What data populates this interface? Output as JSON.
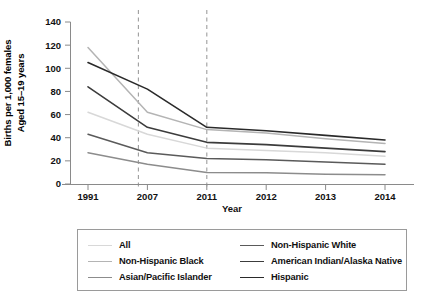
{
  "chart_data": {
    "type": "line",
    "title": "",
    "xlabel": "Year",
    "ylabel_line1": "Births per 1,000 females",
    "ylabel_line2": "Aged 15–19 years",
    "categories": [
      "1991",
      "2007",
      "2011",
      "2012",
      "2013",
      "2014"
    ],
    "x": [
      1991,
      2007,
      2011,
      2012,
      2013,
      2014
    ],
    "ylim": [
      0,
      140
    ],
    "yticks": [
      0,
      20,
      40,
      60,
      80,
      100,
      120,
      140
    ],
    "ytick_labels": [
      "0",
      "20",
      "40",
      "60",
      "80",
      "100",
      "120",
      "140"
    ],
    "grid": false,
    "legend_position": "below-plot",
    "annotations": [
      {
        "type": "vline",
        "style": "dashed",
        "at_category_index": 1,
        "offset_left": true,
        "label": ""
      },
      {
        "type": "vline",
        "style": "dashed",
        "at_category_index": 2,
        "label": ""
      }
    ],
    "series": [
      {
        "name": "All",
        "color": "#d8d8d8",
        "width": 1.5,
        "values": [
          62,
          43,
          31,
          29,
          27,
          24
        ]
      },
      {
        "name": "Non-Hispanic Black",
        "color": "#b4b4b4",
        "width": 1.5,
        "values": [
          118,
          62,
          47,
          44,
          39,
          35
        ]
      },
      {
        "name": "Asian/Pacific Islander",
        "color": "#8c8c8c",
        "width": 1.5,
        "values": [
          27,
          17,
          10,
          9.7,
          8.5,
          8
        ]
      },
      {
        "name": "Non-Hispanic White",
        "color": "#5a5a5a",
        "width": 1.5,
        "values": [
          43,
          27,
          22,
          21,
          19,
          17
        ]
      },
      {
        "name": "American Indian/Alaska Native",
        "color": "#3c3c3c",
        "width": 1.6,
        "values": [
          84,
          49,
          36,
          34,
          31,
          28
        ]
      },
      {
        "name": "Hispanic",
        "color": "#2a2a2a",
        "width": 1.6,
        "values": [
          105,
          82,
          49,
          46,
          42,
          38
        ]
      }
    ],
    "legend_order": [
      "All",
      "Non-Hispanic White",
      "Non-Hispanic Black",
      "American Indian/Alaska Native",
      "Asian/Pacific Islander",
      "Hispanic"
    ]
  },
  "axes": {
    "x_title": "Year",
    "y_title_line1": "Births per 1,000 females",
    "y_title_line2": "Aged 15–19 years"
  },
  "legend": {
    "items": [
      {
        "label": "All",
        "color": "#d8d8d8"
      },
      {
        "label": "Non-Hispanic White",
        "color": "#5a5a5a"
      },
      {
        "label": "Non-Hispanic Black",
        "color": "#b4b4b4"
      },
      {
        "label": "American Indian/Alaska Native",
        "color": "#3c3c3c"
      },
      {
        "label": "Asian/Pacific Islander",
        "color": "#8c8c8c"
      },
      {
        "label": "Hispanic",
        "color": "#2a2a2a"
      }
    ]
  },
  "colors": {
    "axis": "#8a8a8a",
    "text": "#111111",
    "dashed_line": "#9e9e9e",
    "legend_border": "#9a9a9a",
    "background": "#ffffff"
  }
}
